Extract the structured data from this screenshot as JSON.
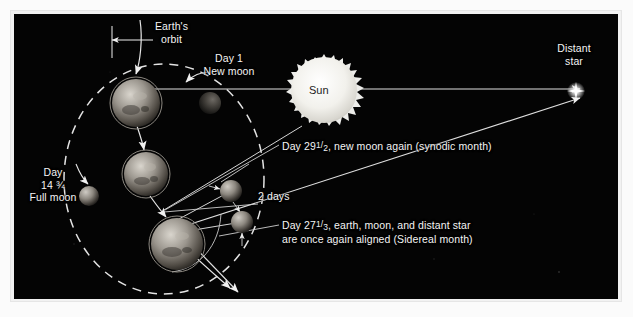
{
  "figure": {
    "background_color": "#040404",
    "frame_color": "#f2f2f2",
    "label_color": "#f4f4f4"
  },
  "labels": {
    "earths_orbit_line1": "Earth's",
    "earths_orbit_line2": "orbit",
    "day1_line1": "Day 1",
    "day1_line2": "New moon",
    "sun": "Sun",
    "distant_star_line1": "Distant",
    "distant_star_line2": "star",
    "full_moon_line1": "Day",
    "full_moon_line2_num": "14",
    "full_moon_line2_frac": "¾",
    "full_moon_line3": "Full moon",
    "synodic_prefix": "Day 29",
    "synodic_frac_num": "1",
    "synodic_frac_den": "2",
    "synodic_rest": ", new moon again (synodic month)",
    "two_days": "2 days",
    "sidereal_prefix": "Day 27",
    "sidereal_frac_num": "1",
    "sidereal_frac_den": "3",
    "sidereal_rest": ", earth, moon, and distant star",
    "sidereal_line2": "are once again aligned (Sidereal month)"
  },
  "bodies": {
    "sun": {
      "name": "Sun",
      "cx": 310,
      "cy": 85,
      "r": 38,
      "color": "#f3f3f0"
    },
    "earth_top": {
      "name": "Earth day 1",
      "cx": 122,
      "cy": 89,
      "r": 24
    },
    "earth_middle": {
      "name": "Earth day 14 3/4",
      "cx": 132,
      "cy": 160,
      "r": 22
    },
    "earth_bottom": {
      "name": "Earth day 27 1/3",
      "cx": 163,
      "cy": 230,
      "r": 26
    },
    "moon_new": {
      "name": "Moon new moon day 1",
      "cx": 196,
      "cy": 89,
      "r": 11
    },
    "moon_full": {
      "name": "Moon full moon day 14 3/4",
      "cx": 75,
      "cy": 182,
      "r": 10
    },
    "moon_sidereal": {
      "name": "Moon day 27 1/3",
      "cx": 217,
      "cy": 177,
      "r": 11
    },
    "moon_synodic": {
      "name": "Moon day 29 1/2",
      "cx": 228,
      "cy": 208,
      "r": 11
    },
    "distant_star": {
      "name": "Distant star",
      "cx": 577,
      "cy": 91
    }
  },
  "orbit": {
    "name": "Earth's orbit dashed ellipse",
    "cx": 150,
    "cy": 165,
    "rx": 100,
    "ry": 115,
    "dash": "9 7",
    "color": "#e8e8e8"
  }
}
